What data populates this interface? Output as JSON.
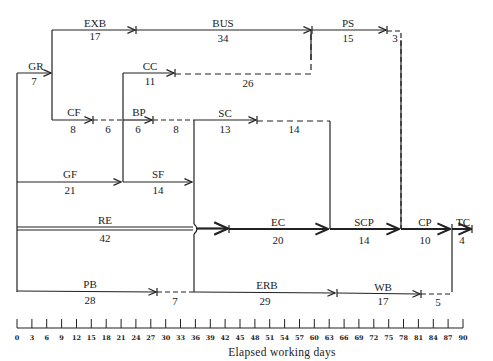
{
  "diagram": {
    "type": "time-scaled network (activity-on-arrow)",
    "axis": {
      "title": "Elapsed working days",
      "ticks": [
        "0",
        "3",
        "6",
        "9",
        "12",
        "15",
        "18",
        "21",
        "24",
        "27",
        "30",
        "33",
        "36",
        "39",
        "42",
        "45",
        "48",
        "51",
        "54",
        "57",
        "60",
        "63",
        "66",
        "69",
        "72",
        "75",
        "78",
        "81",
        "84",
        "87",
        "90"
      ]
    },
    "activities": [
      {
        "code": "GR",
        "duration": "7",
        "start": 0,
        "end": 7
      },
      {
        "code": "EXB",
        "duration": "17",
        "start": 7,
        "end": 24
      },
      {
        "code": "BUS",
        "duration": "34",
        "start": 24,
        "end": 58
      },
      {
        "code": "PS",
        "duration": "15",
        "start": 58,
        "end": 73
      },
      {
        "code": "CC",
        "duration": "11",
        "start": 21,
        "end": 32
      },
      {
        "code": "CF",
        "duration": "8",
        "start": 7,
        "end": 15
      },
      {
        "code": "BP",
        "duration": "6",
        "start": 21,
        "end": 27
      },
      {
        "code": "SC",
        "duration": "13",
        "start": 35,
        "end": 48
      },
      {
        "code": "GF",
        "duration": "21",
        "start": 0,
        "end": 21
      },
      {
        "code": "SF",
        "duration": "14",
        "start": 21,
        "end": 35
      },
      {
        "code": "RE",
        "duration": "42",
        "start": 0,
        "end": 42
      },
      {
        "code": "EC",
        "duration": "20",
        "start": 42,
        "end": 62
      },
      {
        "code": "SCP",
        "duration": "14",
        "start": 62,
        "end": 76
      },
      {
        "code": "CP",
        "duration": "10",
        "start": 76,
        "end": 86
      },
      {
        "code": "TC",
        "duration": "4",
        "start": 86,
        "end": 90
      },
      {
        "code": "PB",
        "duration": "28",
        "start": 0,
        "end": 28
      },
      {
        "code": "ERB",
        "duration": "29",
        "start": 35,
        "end": 64
      },
      {
        "code": "WB",
        "duration": "17",
        "start": 64,
        "end": 81
      }
    ],
    "floats": [
      {
        "after": "PS",
        "value": "3"
      },
      {
        "after": "CC",
        "value": "26"
      },
      {
        "after": "CF",
        "value": "6"
      },
      {
        "after": "BP",
        "value": "8"
      },
      {
        "after": "SC",
        "value": "14"
      },
      {
        "after": "PB",
        "value": "7"
      },
      {
        "after": "WB",
        "value": "5"
      }
    ]
  }
}
